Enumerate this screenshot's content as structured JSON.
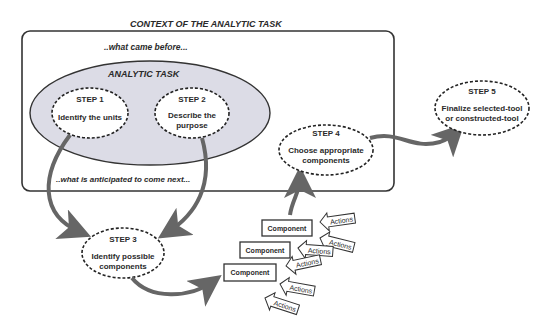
{
  "context": {
    "title": "CONTEXT OF THE ANALYTIC TASK",
    "before_label": "..what came before...",
    "after_label": "..what is anticipated to come next..."
  },
  "analytic_task": {
    "title": "ANALYTIC TASK",
    "fill": "#dcdce6"
  },
  "steps": [
    {
      "label": "STEP 1",
      "line1": "Identify the units",
      "line2": ""
    },
    {
      "label": "STEP 2",
      "line1": "Describe the",
      "line2": "purpose"
    },
    {
      "label": "STEP 3",
      "line1": "Identify possible",
      "line2": "components"
    },
    {
      "label": "STEP 4",
      "line1": "Choose appropriate",
      "line2": "components"
    },
    {
      "label": "STEP 5",
      "line1": "Finalize selected-tool",
      "line2": "or constructed-tool"
    }
  ],
  "components": [
    "Component",
    "Component",
    "Component"
  ],
  "actions": [
    "Actions",
    "Actions",
    "Actions",
    "Actions",
    "Actions",
    "Actions"
  ],
  "colors": {
    "stroke": "#333333",
    "arrow": "#666666",
    "text": "#2a2a2a"
  }
}
